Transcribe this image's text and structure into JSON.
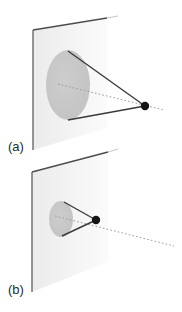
{
  "figure": {
    "title": "",
    "panels": [
      {
        "id": "a",
        "label": "(a)",
        "label_pos": {
          "x": 8,
          "y": 151
        },
        "description": "point source projecting a wide cone onto a plane forming a large ellipse",
        "plane": {
          "name": "projection-plane",
          "fill": "#f2f2f2",
          "edge_color": "#4a4a4a",
          "corners": [
            {
              "x": 33,
              "y": 30
            },
            {
              "x": 107,
              "y": 18
            },
            {
              "x": 107,
              "y": 128
            },
            {
              "x": 33,
              "y": 150
            }
          ],
          "left_edge": {
            "x1": 33,
            "y1": 30,
            "x2": 33,
            "y2": 150
          },
          "top_edge": {
            "x1": 33,
            "y1": 30,
            "x2": 107,
            "y2": 18
          }
        },
        "ellipse": {
          "name": "projected-disk",
          "cx": 68,
          "cy": 85,
          "rx": 22,
          "ry": 35,
          "fill": "#c9c9c9"
        },
        "apex": {
          "name": "point-source",
          "x": 145,
          "y": 106,
          "r": 4.2,
          "color": "#141414"
        },
        "cone_rays": [
          {
            "x1": 68,
            "y1": 51,
            "x2": 145,
            "y2": 106
          },
          {
            "x1": 68,
            "y1": 120,
            "x2": 145,
            "y2": 106
          }
        ],
        "axis": {
          "name": "optical-axis",
          "x1": 58,
          "y1": 84,
          "x2": 164,
          "y2": 110,
          "dash": "1.6 2.2",
          "color": "#9a9a9a"
        },
        "ray_color": "#3a3a3a"
      },
      {
        "id": "b",
        "label": "(b)",
        "label_pos": {
          "x": 8,
          "y": 294
        },
        "description": "point source nearer the plane projecting a narrow cone forming a small ellipse",
        "plane": {
          "name": "projection-plane",
          "fill": "#f2f2f2",
          "edge_color": "#4a4a4a",
          "corners": [
            {
              "x": 32,
              "y": 172
            },
            {
              "x": 108,
              "y": 152
            },
            {
              "x": 108,
              "y": 262
            },
            {
              "x": 32,
              "y": 292
            }
          ],
          "left_edge": {
            "x1": 32,
            "y1": 172,
            "x2": 32,
            "y2": 292
          },
          "top_edge": {
            "x1": 32,
            "y1": 172,
            "x2": 108,
            "y2": 152
          }
        },
        "ellipse": {
          "name": "projected-disk",
          "cx": 61,
          "cy": 219,
          "rx": 12,
          "ry": 18,
          "fill": "#c9c9c9"
        },
        "apex": {
          "name": "point-source",
          "x": 96,
          "y": 220,
          "r": 4.2,
          "color": "#141414"
        },
        "cone_rays": [
          {
            "x1": 64,
            "y1": 202,
            "x2": 96,
            "y2": 220
          },
          {
            "x1": 62,
            "y1": 236,
            "x2": 96,
            "y2": 220
          }
        ],
        "axis": {
          "name": "optical-axis",
          "x1": 55,
          "y1": 216,
          "x2": 174,
          "y2": 246,
          "dash": "1.6 2.2",
          "color": "#9a9a9a"
        },
        "ray_color": "#3a3a3a"
      }
    ],
    "colors": {
      "background": "#ffffff",
      "plane_fill": "#f2f2f2",
      "disk_fill": "#c9c9c9",
      "edge": "#4a4a4a",
      "ray": "#3a3a3a",
      "axis": "#9a9a9a",
      "point": "#141414",
      "label_text": "#2b2b2b"
    }
  }
}
